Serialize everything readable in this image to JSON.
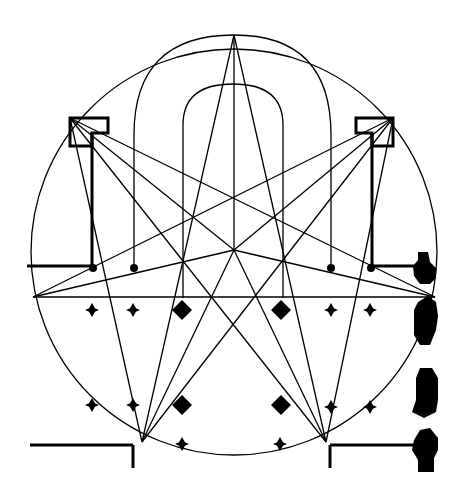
{
  "diagram": {
    "colors": {
      "ink": "#000000",
      "paper": "#ffffff"
    },
    "circle": {
      "cx": 234,
      "cy": 252,
      "r": 203
    },
    "star_points": [
      {
        "name": "top",
        "x": 234,
        "y": 35
      },
      {
        "name": "upper-left-speaker",
        "x": 70,
        "y": 118
      },
      {
        "name": "upper-right-speaker",
        "x": 393,
        "y": 118
      },
      {
        "name": "left",
        "x": 33,
        "y": 297
      },
      {
        "name": "right",
        "x": 435,
        "y": 297
      },
      {
        "name": "bottom-left",
        "x": 142,
        "y": 442
      },
      {
        "name": "bottom-right",
        "x": 326,
        "y": 442
      }
    ],
    "speakers": [
      {
        "name": "speaker-left",
        "x": 70,
        "y": 118,
        "w": 38,
        "h": 28
      },
      {
        "name": "speaker-right",
        "x": 356,
        "y": 118,
        "w": 38,
        "h": 28
      }
    ],
    "arches": [
      {
        "name": "outer-arch",
        "left_x": 134,
        "right_x": 331,
        "top_y": 35,
        "base_y": 268
      },
      {
        "name": "inner-arch",
        "left_x": 183,
        "right_x": 283,
        "top_y": 84,
        "base_y": 298
      }
    ],
    "small_markers": [
      {
        "x": 92,
        "y": 310
      },
      {
        "x": 133,
        "y": 310
      },
      {
        "x": 331,
        "y": 310
      },
      {
        "x": 370,
        "y": 310
      },
      {
        "x": 92,
        "y": 405
      },
      {
        "x": 133,
        "y": 405
      },
      {
        "x": 331,
        "y": 407
      },
      {
        "x": 370,
        "y": 407
      },
      {
        "x": 182,
        "y": 444
      },
      {
        "x": 280,
        "y": 444
      }
    ],
    "large_markers": [
      {
        "x": 182,
        "y": 310
      },
      {
        "x": 281,
        "y": 310
      },
      {
        "x": 182,
        "y": 405
      },
      {
        "x": 281,
        "y": 405
      }
    ],
    "dots": [
      {
        "x": 93,
        "y": 268
      },
      {
        "x": 134,
        "y": 268
      },
      {
        "x": 331,
        "y": 268
      },
      {
        "x": 371,
        "y": 268
      }
    ]
  }
}
